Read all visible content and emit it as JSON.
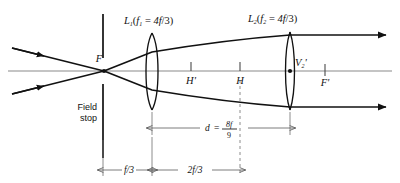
{
  "figure": {
    "type": "optics-ray-diagram"
  },
  "labels": {
    "lens1": {
      "name": "L",
      "name_sub": "1",
      "open_paren": "(",
      "focal_symbol": "f",
      "focal_sub": "1",
      "equals": " = ",
      "focal_value_num": "4f",
      "focal_value_den": "/3",
      "close_paren": ")",
      "full": "L₁(f₁ = 4f/3)"
    },
    "lens2": {
      "name": "L",
      "name_sub": "2",
      "open_paren": "(",
      "focal_symbol": "f",
      "focal_sub": "2",
      "equals": " = ",
      "focal_value_num": "4f",
      "focal_value_den": "/3",
      "close_paren": ")",
      "full": "L₂(f₂ = 4f/3)"
    },
    "front_focal_point": "F",
    "back_focal_point": "F'",
    "principal_plane_primed": "H'",
    "principal_plane": "H",
    "vertex2": "V",
    "vertex2_sub": "2",
    "vertex2_prime": "'",
    "field_stop_line1": "Field",
    "field_stop_line2": "stop"
  },
  "dimensions": {
    "separation": {
      "symbol": "d",
      "equals": "=",
      "numerator": "8f",
      "denominator": "9",
      "full": "d = 8f/9"
    },
    "stop_to_lens1": "f/3",
    "lens1_to_H": "2f/3"
  },
  "colors": {
    "ink": "#111111",
    "axis": "#7c7c7c",
    "dimension": "#5a5a5a",
    "paper": "#ffffff"
  }
}
